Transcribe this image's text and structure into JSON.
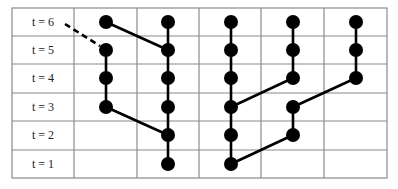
{
  "grid": {
    "left": 12,
    "top": 8,
    "right": 387,
    "bottom": 178,
    "label_col_right": 74,
    "col_lines": [
      74,
      137,
      199,
      261,
      324
    ],
    "row_lines": [
      36,
      64,
      93,
      121,
      150
    ],
    "line_color": "#8a8a8a"
  },
  "rows": [
    {
      "label": "t = 6",
      "t": 6,
      "y": 22
    },
    {
      "label": "t = 5",
      "t": 5,
      "y": 50
    },
    {
      "label": "t = 4",
      "t": 4,
      "y": 78
    },
    {
      "label": "t = 3",
      "t": 3,
      "y": 107
    },
    {
      "label": "t = 2",
      "t": 2,
      "y": 135
    },
    {
      "label": "t = 1",
      "t": 1,
      "y": 164
    }
  ],
  "columns_x": [
    106,
    168,
    231,
    293,
    356
  ],
  "node_color": "#000000",
  "node_radius": 7,
  "nodes": [
    {
      "col": 0,
      "t": 5
    },
    {
      "col": 0,
      "t": 4
    },
    {
      "col": 0,
      "t": 3
    },
    {
      "col": 1,
      "t": 6
    },
    {
      "col": 1,
      "t": 5
    },
    {
      "col": 1,
      "t": 4
    },
    {
      "col": 1,
      "t": 3
    },
    {
      "col": 1,
      "t": 2
    },
    {
      "col": 1,
      "t": 1
    },
    {
      "col": 2,
      "t": 6
    },
    {
      "col": 2,
      "t": 5
    },
    {
      "col": 2,
      "t": 4
    },
    {
      "col": 2,
      "t": 3
    },
    {
      "col": 2,
      "t": 2
    },
    {
      "col": 2,
      "t": 1
    },
    {
      "col": 3,
      "t": 6
    },
    {
      "col": 3,
      "t": 5
    },
    {
      "col": 3,
      "t": 4
    },
    {
      "col": 3,
      "t": 3
    },
    {
      "col": 3,
      "t": 2
    },
    {
      "col": 4,
      "t": 6
    },
    {
      "col": 4,
      "t": 5
    },
    {
      "col": 4,
      "t": 4
    }
  ],
  "edges": [
    {
      "from": [
        0,
        5
      ],
      "to": [
        0,
        4
      ]
    },
    {
      "from": [
        0,
        4
      ],
      "to": [
        0,
        3
      ]
    },
    {
      "from": [
        0,
        3
      ],
      "to": [
        1,
        2
      ]
    },
    {
      "from": [
        0,
        6
      ],
      "to": [
        1,
        5
      ],
      "from_col_offset": -62
    },
    {
      "from": [
        1,
        6
      ],
      "to": [
        1,
        5
      ]
    },
    {
      "from": [
        1,
        5
      ],
      "to": [
        1,
        4
      ]
    },
    {
      "from": [
        1,
        4
      ],
      "to": [
        1,
        3
      ]
    },
    {
      "from": [
        1,
        3
      ],
      "to": [
        1,
        2
      ]
    },
    {
      "from": [
        1,
        2
      ],
      "to": [
        1,
        1
      ]
    },
    {
      "from": [
        2,
        6
      ],
      "to": [
        2,
        5
      ]
    },
    {
      "from": [
        2,
        5
      ],
      "to": [
        2,
        4
      ]
    },
    {
      "from": [
        2,
        4
      ],
      "to": [
        2,
        3
      ]
    },
    {
      "from": [
        2,
        3
      ],
      "to": [
        2,
        2
      ]
    },
    {
      "from": [
        2,
        2
      ],
      "to": [
        2,
        1
      ]
    },
    {
      "from": [
        3,
        6
      ],
      "to": [
        3,
        5
      ]
    },
    {
      "from": [
        3,
        5
      ],
      "to": [
        3,
        4
      ]
    },
    {
      "from": [
        3,
        4
      ],
      "to": [
        2,
        3
      ]
    },
    {
      "from": [
        3,
        3
      ],
      "to": [
        3,
        2
      ]
    },
    {
      "from": [
        3,
        2
      ],
      "to": [
        2,
        1
      ]
    },
    {
      "from": [
        4,
        6
      ],
      "to": [
        4,
        5
      ]
    },
    {
      "from": [
        4,
        5
      ],
      "to": [
        4,
        4
      ]
    },
    {
      "from": [
        4,
        4
      ],
      "to": [
        3,
        3
      ]
    }
  ],
  "dashed_edge": {
    "x1": 65,
    "y1": 24,
    "x2": 100,
    "y2": 46
  }
}
